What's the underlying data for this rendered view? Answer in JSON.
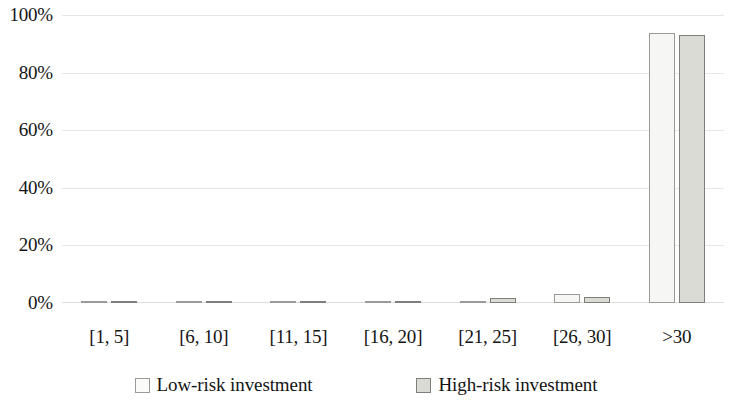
{
  "chart_data": {
    "type": "bar",
    "title": "",
    "subtitle": "",
    "xlabel": "",
    "ylabel": "",
    "ylim": [
      0,
      100
    ],
    "y_tick_labels": [
      "100%",
      "80%",
      "60%",
      "40%",
      "20%",
      "0%"
    ],
    "y_tick_values": [
      100,
      80,
      60,
      40,
      20,
      0
    ],
    "grid": true,
    "legend_position": "bottom",
    "categories": [
      "[1, 5]",
      "[6, 10]",
      "[11, 15]",
      "[16, 20]",
      "[21, 25]",
      "[26, 30]",
      ">30"
    ],
    "series": [
      {
        "name": "Low-risk investment",
        "color": "#f6f6f4",
        "border_color": "#9a9a96",
        "values": [
          0.1,
          0.3,
          0.2,
          0.2,
          0.3,
          3.0,
          94.0
        ]
      },
      {
        "name": "High-risk investment",
        "color": "#dbdbd6",
        "border_color": "#7e7e7a",
        "values": [
          0.1,
          0.2,
          0.3,
          0.8,
          1.6,
          2.2,
          93.4
        ]
      }
    ]
  },
  "legend": {
    "items": [
      {
        "label": "Low-risk investment",
        "swatch": "low-risk-swatch"
      },
      {
        "label": "High-risk investment",
        "swatch": "high-risk-swatch"
      }
    ]
  }
}
